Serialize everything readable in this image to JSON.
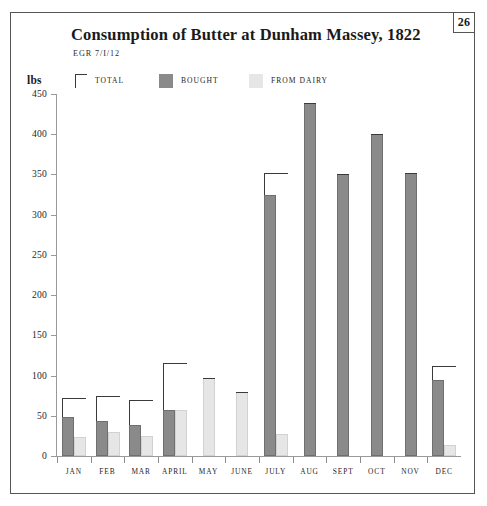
{
  "page_number": "26",
  "header": {
    "title": "Consumption of Butter at Dunham Massey, 1822",
    "subtitle": "EGR 7/I/12"
  },
  "legend": {
    "items": [
      {
        "label": "TOTAL",
        "marker": "bracket",
        "color": "#3a3a3a"
      },
      {
        "label": "BOUGHT",
        "marker": "swatch",
        "color": "#8a8a8a"
      },
      {
        "label": "FROM DAIRY",
        "marker": "swatch",
        "color": "#e6e6e6"
      }
    ]
  },
  "axis": {
    "y_unit_label": "lbs",
    "y_ticks": [
      "450",
      "400",
      "350",
      "300",
      "250",
      "200",
      "150",
      "100",
      "50",
      "0"
    ]
  },
  "chart_data": {
    "type": "bar",
    "title": "Consumption of Butter at Dunham Massey, 1822",
    "subtitle": "EGR 7/I/12",
    "xlabel": "",
    "ylabel": "lbs",
    "ylim": [
      0,
      450
    ],
    "ytick_step": 50,
    "grid": false,
    "legend_position": "top",
    "categories": [
      "JAN",
      "FEB",
      "MAR",
      "APRIL",
      "MAY",
      "JUNE",
      "JULY",
      "AUG",
      "SEPT",
      "OCT",
      "NOV",
      "DEC"
    ],
    "series": [
      {
        "name": "TOTAL",
        "color": "#3a3a3a",
        "style": "bracket",
        "values": [
          72,
          74,
          70,
          115,
          97,
          79,
          352,
          439,
          350,
          400,
          352,
          112
        ]
      },
      {
        "name": "BOUGHT",
        "color": "#8a8a8a",
        "style": "bar",
        "values": [
          49,
          44,
          38,
          57,
          0,
          0,
          325,
          439,
          350,
          400,
          352,
          95
        ]
      },
      {
        "name": "FROM DAIRY",
        "color": "#e6e6e6",
        "style": "bar",
        "values": [
          23,
          30,
          25,
          57,
          97,
          79,
          27,
          0,
          0,
          0,
          0,
          14
        ]
      }
    ]
  }
}
